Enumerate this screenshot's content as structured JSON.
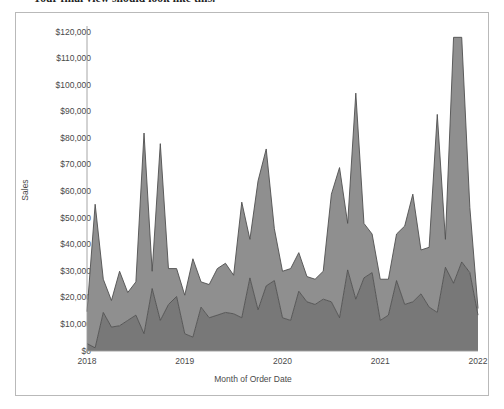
{
  "caption": {
    "text": "Your final view should look like this."
  },
  "chart_data": {
    "type": "area",
    "stacked": true,
    "title": "",
    "subtitle": "",
    "xlabel": "Month of Order Date",
    "ylabel": "Sales",
    "ylim": [
      0,
      120000
    ],
    "ytick_labels": [
      "$120,000",
      "$110,000",
      "$100,000",
      "$90,000",
      "$80,000",
      "$70,000",
      "$60,000",
      "$50,000",
      "$40,000",
      "$30,000",
      "$20,000",
      "$10,000",
      "$0"
    ],
    "ytick_values": [
      120000,
      110000,
      100000,
      90000,
      80000,
      70000,
      60000,
      50000,
      40000,
      30000,
      20000,
      10000,
      0
    ],
    "xtick_labels": [
      "2018",
      "2019",
      "2020",
      "2021",
      "2022"
    ],
    "xlim": [
      "2018-01",
      "2022-01"
    ],
    "grid": false,
    "legend": "none",
    "colors": {
      "series_upper": "#8f8f8f",
      "series_lower": "#787878",
      "line": "#4f4f4f",
      "axis": "#9c9c9c",
      "text": "#4a4a4a",
      "panel_border": "#b9b9b9",
      "background": "#ffffff"
    },
    "x": [
      "2018-01",
      "2018-02",
      "2018-03",
      "2018-04",
      "2018-05",
      "2018-06",
      "2018-07",
      "2018-08",
      "2018-09",
      "2018-10",
      "2018-11",
      "2018-12",
      "2019-01",
      "2019-02",
      "2019-03",
      "2019-04",
      "2019-05",
      "2019-06",
      "2019-07",
      "2019-08",
      "2019-09",
      "2019-10",
      "2019-11",
      "2019-12",
      "2020-01",
      "2020-02",
      "2020-03",
      "2020-04",
      "2020-05",
      "2020-06",
      "2020-07",
      "2020-08",
      "2020-09",
      "2020-10",
      "2020-11",
      "2020-12",
      "2021-01",
      "2021-02",
      "2021-03",
      "2021-04",
      "2021-05",
      "2021-06",
      "2021-07",
      "2021-08",
      "2021-09",
      "2021-10",
      "2021-11",
      "2021-12",
      "2022-01"
    ],
    "series": [
      {
        "name": "Lower band",
        "values": [
          2800,
          1200,
          14500,
          9000,
          9500,
          11500,
          13500,
          6500,
          23500,
          11500,
          17500,
          20500,
          6500,
          5200,
          16500,
          12500,
          13500,
          14500,
          14000,
          12500,
          27500,
          15500,
          24500,
          26500,
          12500,
          11500,
          22500,
          18500,
          17500,
          19500,
          18500,
          12500,
          30500,
          19500,
          27500,
          29500,
          11500,
          13500,
          26500,
          17500,
          18500,
          21500,
          16500,
          14500,
          31500,
          25500,
          33500,
          29500,
          13500
        ]
      },
      {
        "name": "Upper band",
        "values": [
          12000,
          54000,
          12500,
          10000,
          20500,
          10500,
          12500,
          75500,
          6500,
          66500,
          13500,
          10500,
          14500,
          29500,
          9500,
          12500,
          17500,
          18500,
          14500,
          43500,
          14500,
          48500,
          51500,
          19500,
          17500,
          19500,
          14500,
          9500,
          9500,
          10500,
          40500,
          56500,
          17500,
          77500,
          20500,
          14500,
          15500,
          13500,
          17500,
          29500,
          40500,
          16500,
          22500,
          74500,
          10500,
          92500,
          84500,
          24500,
          2500
        ]
      }
    ]
  }
}
